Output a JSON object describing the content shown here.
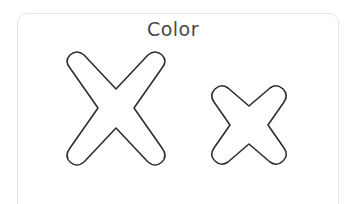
{
  "worksheet": {
    "title": "Color",
    "letters": [
      {
        "name": "uppercase-x",
        "char": "X"
      },
      {
        "name": "lowercase-x",
        "char": "x"
      }
    ],
    "colors": {
      "outline": "#2e2e2e",
      "border": "#e4e4e4",
      "title": "#4a4a4a"
    }
  }
}
